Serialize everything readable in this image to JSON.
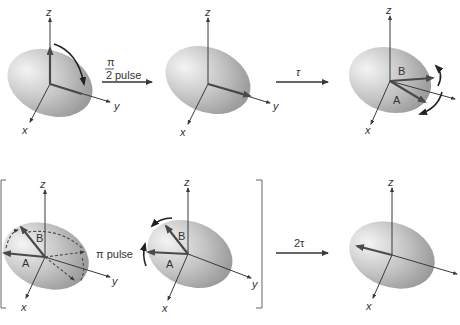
{
  "diagram": {
    "type": "spin-echo sequence",
    "axes": {
      "x": "x",
      "y": "y",
      "z": "z"
    },
    "panels": [
      {
        "id": "p1",
        "row": 1,
        "description": "Magnetization along z, rotating toward y",
        "vectors": [],
        "labels": []
      },
      {
        "id": "p2",
        "row": 1,
        "description": "Magnetization along y after pulse",
        "vectors": [],
        "labels": []
      },
      {
        "id": "p3",
        "row": 1,
        "description": "Dephasing: components A and B fan out",
        "labels": [
          "B",
          "A"
        ]
      },
      {
        "id": "p4",
        "row": 2,
        "description": "Inversion by pi pulse (dashed before, solid after)",
        "labels": [
          "B",
          "A"
        ]
      },
      {
        "id": "p5",
        "row": 2,
        "description": "Components rotate back toward -y",
        "labels": [
          "B",
          "A"
        ]
      },
      {
        "id": "p6",
        "row": 2,
        "description": "Refocused echo along -y",
        "labels": []
      }
    ],
    "steps": {
      "pulse1": {
        "numerator": "π",
        "denominator": "2",
        "label": "pulse"
      },
      "delay1": {
        "label": "τ"
      },
      "pulse2": {
        "label": "π pulse"
      },
      "delay2": {
        "label": "2τ"
      }
    },
    "labels": {
      "A": "A",
      "B": "B"
    }
  },
  "colors": {
    "ellipsoid_light": "#f2f2f2",
    "ellipsoid_dark": "#8a8a8a",
    "vector": "#4a4a4a",
    "axis": "#3a3a3a"
  }
}
